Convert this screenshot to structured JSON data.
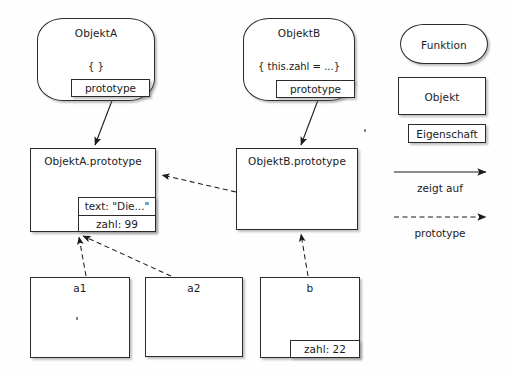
{
  "diagram": {
    "language": "de",
    "background": "#fefefe",
    "stroke": "#2b2b2b"
  },
  "nodes": {
    "objektA": {
      "title": "ObjektA",
      "body": "{ }",
      "prototype_label": "prototype"
    },
    "objektB": {
      "title": "ObjektB",
      "body": "{ this.zahl = ...}",
      "prototype_label": "prototype"
    },
    "objektA_prototype": {
      "title": "ObjektA.prototype",
      "props": [
        "text: \"Die...\"",
        "zahl: 99"
      ]
    },
    "objektB_prototype": {
      "title": "ObjektB.prototype",
      "props": []
    },
    "a1": {
      "title": "a1",
      "props": []
    },
    "a2": {
      "title": "a2",
      "props": []
    },
    "b": {
      "title": "b",
      "props": [
        "zahl: 22"
      ]
    }
  },
  "legend": {
    "funktion_label": "Funktion",
    "objekt_label": "Objekt",
    "eigenschaft_label": "Eigenschaft",
    "zeigt_auf_label": "zeigt auf",
    "prototype_label": "prototype"
  },
  "edges": [
    {
      "name": "objektA-prototype-to-objektA-prototype-node",
      "kind": "zeigt auf",
      "style": "solid",
      "from": "ObjektA.prototype property",
      "to": "ObjektA.prototype object"
    },
    {
      "name": "objektB-prototype-to-objektB-prototype-node",
      "kind": "zeigt auf",
      "style": "solid",
      "from": "ObjektB.prototype property",
      "to": "ObjektB.prototype object"
    },
    {
      "name": "objektB-prototype-to-objektA-prototype",
      "kind": "prototype",
      "style": "dashed",
      "from": "ObjektB.prototype",
      "to": "ObjektA.prototype"
    },
    {
      "name": "a1-to-objektA-prototype",
      "kind": "prototype",
      "style": "dashed",
      "from": "a1",
      "to": "ObjektA.prototype"
    },
    {
      "name": "a2-to-objektA-prototype",
      "kind": "prototype",
      "style": "dashed",
      "from": "a2",
      "to": "ObjektA.prototype"
    },
    {
      "name": "b-to-objektB-prototype",
      "kind": "prototype",
      "style": "dashed",
      "from": "b",
      "to": "ObjektB.prototype"
    }
  ]
}
